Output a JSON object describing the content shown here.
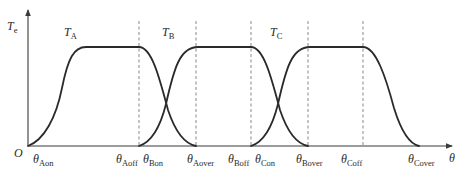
{
  "diagram": {
    "title": "",
    "y_axis": {
      "symbol": "T",
      "subscript": "e"
    },
    "x_axis": {
      "symbol": "θ"
    },
    "origin_label": "O",
    "curves": [
      {
        "name": "T",
        "subscript": "A",
        "on": "θAon",
        "off": "θAoff",
        "over": "θAover"
      },
      {
        "name": "T",
        "subscript": "B",
        "on": "θBon",
        "off": "θBoff",
        "over": "θBover"
      },
      {
        "name": "T",
        "subscript": "C",
        "on": "θCon",
        "off": "θCoff",
        "over": "θCover"
      }
    ],
    "x_ticks": [
      {
        "symbol": "θ",
        "subscript": "Aon"
      },
      {
        "symbol": "θ",
        "subscript": "Aoff"
      },
      {
        "symbol": "θ",
        "subscript": "Bon"
      },
      {
        "symbol": "θ",
        "subscript": "Aover"
      },
      {
        "symbol": "θ",
        "subscript": "Boff"
      },
      {
        "symbol": "θ",
        "subscript": "Con"
      },
      {
        "symbol": "θ",
        "subscript": "Bover"
      },
      {
        "symbol": "θ",
        "subscript": "Coff"
      },
      {
        "symbol": "θ",
        "subscript": "Cover"
      }
    ],
    "colors": {
      "curve": "#2a2a2a",
      "axis": "#3a3a3a",
      "dashed": "#7a7a7a"
    }
  }
}
